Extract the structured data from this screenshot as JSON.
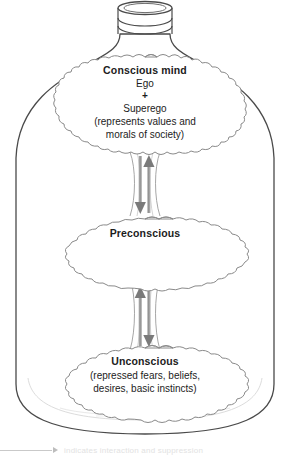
{
  "figure": {
    "container_label": "bottle-vessel"
  },
  "clouds": [
    {
      "id": "conscious",
      "heading": "Conscious mind",
      "lines": [
        "Ego",
        "+",
        "Superego",
        "(represents values and",
        "morals of society)"
      ]
    },
    {
      "id": "preconscious",
      "heading": "Preconscious",
      "lines": []
    },
    {
      "id": "unconscious",
      "heading": "Unconscious",
      "lines": [
        "(repressed fears, beliefs,",
        "desires, basic instincts)"
      ]
    }
  ],
  "connectors": [
    {
      "id": "conscious-preconscious",
      "up_label": "upward flow arrow",
      "down_label": "downward flow arrow"
    },
    {
      "id": "preconscious-unconscious",
      "up_label": "upward flow arrow",
      "down_label": "downward flow arrow"
    }
  ],
  "legend": {
    "caption": "indicates interaction and suppression"
  },
  "colors": {
    "outline": "#4a4a4a",
    "cloud_outline": "#808080",
    "arrow_fill": "#7a7a7a",
    "arrow_shaft": "#9a9a9a",
    "text": "#1c1c1c",
    "background": "#ffffff",
    "legend_rule": "#c9c9c9"
  }
}
